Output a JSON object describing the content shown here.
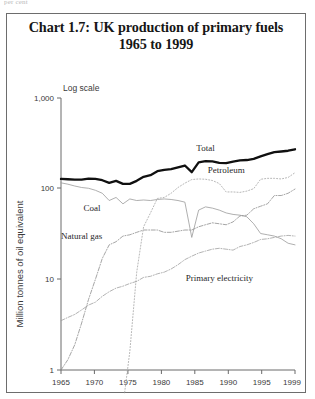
{
  "page": {
    "top_fragment": "per cent"
  },
  "chart_data": {
    "type": "line",
    "title": "Chart 1.7: UK production of primary fuels",
    "subtitle": "1965 to 1999",
    "scale_note": "Log scale",
    "ylabel": "Million tonnes of oil equivalent",
    "xlabel": "",
    "yscale": "log",
    "ylim": [
      1,
      1000
    ],
    "ytick_labels": [
      "1,000",
      "100",
      "10",
      "1"
    ],
    "ytick_values": [
      1000,
      100,
      10,
      1
    ],
    "xlim": [
      1965,
      1999
    ],
    "xtick_labels": [
      "1965",
      "1970",
      "1975",
      "1980",
      "1985",
      "1990",
      "1995",
      "1999"
    ],
    "xtick_values": [
      1965,
      1970,
      1975,
      1980,
      1985,
      1990,
      1995,
      1999
    ],
    "grid": false,
    "legend_position": "inline-labels",
    "x": [
      1965,
      1966,
      1967,
      1968,
      1969,
      1970,
      1971,
      1972,
      1973,
      1974,
      1975,
      1976,
      1977,
      1978,
      1979,
      1980,
      1981,
      1982,
      1983,
      1984,
      1985,
      1986,
      1987,
      1988,
      1989,
      1990,
      1991,
      1992,
      1993,
      1994,
      1995,
      1996,
      1997,
      1998,
      1999
    ],
    "series": [
      {
        "name": "Total",
        "style": "bold-solid",
        "color": "#101010",
        "values": [
          128,
          127,
          126,
          126,
          129,
          128,
          124,
          116,
          122,
          113,
          113,
          122,
          135,
          141,
          156,
          161,
          164,
          172,
          180,
          152,
          195,
          201,
          200,
          193,
          191,
          199,
          205,
          207,
          213,
          227,
          240,
          253,
          257,
          262,
          272
        ]
      },
      {
        "name": "Coal",
        "style": "thin-solid",
        "color": "#9a9a9a",
        "values": [
          116,
          112,
          107,
          103,
          101,
          96,
          89,
          74,
          80,
          68,
          77,
          74,
          75,
          74,
          76,
          77,
          76,
          74,
          71,
          29,
          58,
          63,
          61,
          58,
          54,
          52,
          51,
          49,
          41,
          32,
          31,
          30,
          28,
          25,
          24
        ]
      },
      {
        "name": "Natural gas",
        "style": "dash-dot",
        "color": "#8e8e8e",
        "values": [
          1.0,
          1.3,
          1.9,
          3.3,
          6.0,
          10.0,
          17.0,
          24.0,
          26.0,
          30.0,
          31.0,
          33.0,
          35.0,
          35.0,
          35.0,
          33.0,
          33.0,
          34.0,
          35.0,
          35.0,
          38.0,
          40.0,
          42.0,
          41.0,
          40.0,
          43.0,
          50.0,
          51.0,
          60.0,
          64.0,
          68.0,
          84.0,
          84.0,
          89.0,
          99.0
        ]
      },
      {
        "name": "Petroleum",
        "style": "dotted",
        "color": "#a5a5a5",
        "values": [
          0.1,
          0.1,
          0.1,
          0.1,
          0.1,
          0.1,
          0.2,
          0.3,
          0.4,
          0.4,
          1.6,
          12.0,
          38.0,
          54.0,
          78.0,
          80.0,
          89.0,
          103.0,
          115.0,
          126.0,
          128.0,
          127.0,
          123.0,
          114.0,
          92.0,
          92.0,
          91.0,
          94.0,
          100.0,
          127.0,
          130.0,
          130.0,
          128.0,
          133.0,
          150.0
        ]
      },
      {
        "name": "Primary electricity",
        "style": "dash-dot",
        "color": "#9f9f9f",
        "values": [
          3.5,
          3.8,
          4.1,
          4.6,
          5.2,
          5.6,
          6.5,
          7.3,
          8.0,
          8.4,
          9.0,
          9.5,
          10.5,
          10.8,
          11.5,
          12.0,
          13.0,
          14.5,
          16.5,
          18.0,
          19.5,
          20.5,
          21.5,
          22.0,
          21.5,
          21.0,
          23.0,
          24.0,
          25.5,
          27.5,
          28.0,
          29.0,
          30.0,
          30.5,
          30.0
        ]
      }
    ],
    "annotations": [
      {
        "label": "Total",
        "x": 1986,
        "y": 260
      },
      {
        "label": "Petroleum",
        "x": 1989,
        "y": 148
      },
      {
        "label": "Coal",
        "x": 1969.5,
        "y": 57
      },
      {
        "label": "Natural gas",
        "x": 1968,
        "y": 28
      },
      {
        "label": "Primary electricity",
        "x": 1988,
        "y": 9.5
      }
    ]
  }
}
